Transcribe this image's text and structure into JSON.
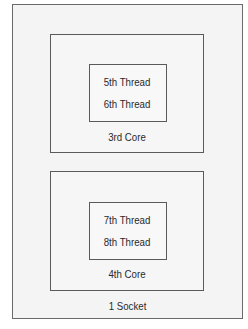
{
  "diagram": {
    "socket": {
      "label": "1 Socket",
      "cores": [
        {
          "label": "3rd Core",
          "threads": [
            "5th Thread",
            "6th Thread"
          ]
        },
        {
          "label": "4th Core",
          "threads": [
            "7th Thread",
            "8th Thread"
          ]
        }
      ]
    }
  },
  "colors": {
    "border": "#5a5a5a",
    "background": "#f4f4f4",
    "text": "#2a2a2a"
  }
}
